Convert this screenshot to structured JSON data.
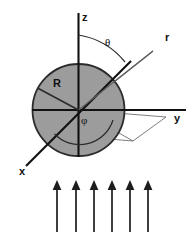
{
  "figure": {
    "background_color": "#ffffff",
    "width": 195,
    "height": 238
  },
  "sphere": {
    "name": "sphere",
    "fill_color": "#9c9c9c",
    "stroke_color": "#2b2b2b",
    "center_x": 78.5,
    "center_y": 110,
    "radius": 46,
    "radius_label": "R"
  },
  "axes": [
    {
      "id": "z",
      "label": "z",
      "label_x": 82,
      "label_y": 21,
      "color": "#111111"
    },
    {
      "id": "y",
      "label": "y",
      "label_x": 174,
      "label_y": 122,
      "color": "#111111"
    },
    {
      "id": "x",
      "label": "x",
      "label_x": 19,
      "label_y": 175,
      "color": "#111111"
    }
  ],
  "vectors": [
    {
      "id": "r",
      "label": "r",
      "label_x": 165,
      "label_y": 41,
      "color": "#555555",
      "description": "radial position vector from origin"
    }
  ],
  "angles": [
    {
      "id": "theta",
      "label": "θ",
      "label_x": 105,
      "label_y": 46,
      "description": "polar angle measured from z-axis to r"
    },
    {
      "id": "phi",
      "label": "φ",
      "label_x": 81,
      "label_y": 124,
      "description": "azimuthal angle measured in xy-plane from x-axis"
    }
  ],
  "radius_marker": {
    "label": "R",
    "label_x": 53,
    "label_y": 87,
    "description": "sphere radius line drawn toward upper-left"
  },
  "illumination_arrows": {
    "name": "upward-illumination-arrows",
    "count": 6,
    "color": "#1d1d1d",
    "direction": "up",
    "tip_y": 181,
    "tail_y": 232,
    "x_positions": [
      57,
      76,
      94,
      112,
      130,
      148
    ]
  },
  "colors": {
    "sphere_fill": "#9c9c9c",
    "outline": "#2b2b2b",
    "axis": "#111111",
    "thin_line": "#6e6e6e",
    "arrow": "#1d1d1d",
    "background": "#ffffff"
  }
}
